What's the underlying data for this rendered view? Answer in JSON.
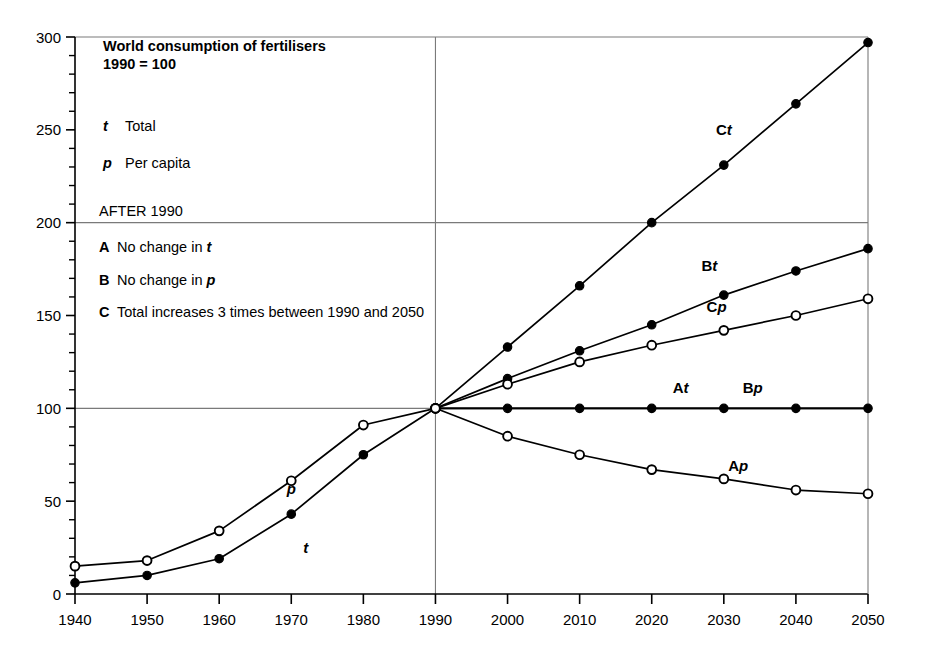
{
  "chart_data": {
    "type": "line",
    "title": "World consumption of fertilisers",
    "subtitle": "1990 = 100",
    "xlabel": "",
    "ylabel": "",
    "xlim": [
      1940,
      2050
    ],
    "ylim": [
      0,
      300
    ],
    "x_ticks": [
      "1940",
      "1950",
      "1960",
      "1970",
      "1980",
      "1990",
      "2000",
      "2010",
      "2020",
      "2030",
      "2040",
      "2050"
    ],
    "y_ticks": [
      "0",
      "50",
      "100",
      "150",
      "200",
      "250",
      "300"
    ],
    "y_minor_tick_step": 10,
    "grid": "horizontal gridlines at 100, 200, 300; vertical gridline at 1990",
    "legend_position": "inside-top-left",
    "legend": [
      {
        "key": "t",
        "key_style": "bold-italic",
        "label": "Total"
      },
      {
        "key": "p",
        "key_style": "bold-italic",
        "label": "Per capita"
      }
    ],
    "scenario_heading": "AFTER 1990",
    "scenarios": [
      {
        "key": "A",
        "label_prefix": "No change in ",
        "label_symbol": "t"
      },
      {
        "key": "B",
        "label_prefix": "No change in ",
        "label_symbol": "p"
      },
      {
        "key": "C",
        "label_prefix": "Total increases 3 times between 1990 and 2050",
        "label_symbol": ""
      }
    ],
    "marker_legend": {
      "filled_circle": "Total (t) series",
      "open_circle": "Per capita (p) series"
    },
    "series": [
      {
        "name": "t",
        "display_label": "t",
        "label_style": "bold-italic",
        "marker": "filled-circle",
        "period": "historical",
        "x": [
          1940,
          1950,
          1960,
          1970,
          1980,
          1990
        ],
        "values": [
          6,
          10,
          19,
          43,
          75,
          100
        ],
        "label_pos": {
          "x": 1972,
          "y": 22
        }
      },
      {
        "name": "p",
        "display_label": "p",
        "label_style": "bold-italic",
        "marker": "open-circle",
        "period": "historical",
        "x": [
          1940,
          1950,
          1960,
          1970,
          1980,
          1990
        ],
        "values": [
          15,
          18,
          34,
          61,
          91,
          100
        ],
        "label_pos": {
          "x": 1970,
          "y": 54
        }
      },
      {
        "name": "Ct",
        "display_label": "Ct",
        "label_style": "bold + bold-italic",
        "marker": "filled-circle",
        "period": "projection",
        "x": [
          1990,
          2000,
          2010,
          2020,
          2030,
          2040,
          2050
        ],
        "values": [
          100,
          133,
          166,
          200,
          231,
          264,
          297
        ],
        "label_pos": {
          "x": 2030,
          "y": 247
        }
      },
      {
        "name": "Bt",
        "display_label": "Bt",
        "label_style": "bold + bold-italic",
        "marker": "filled-circle",
        "period": "projection",
        "x": [
          1990,
          2000,
          2010,
          2020,
          2030,
          2040,
          2050
        ],
        "values": [
          100,
          116,
          131,
          145,
          161,
          174,
          186
        ],
        "label_pos": {
          "x": 2028,
          "y": 174
        }
      },
      {
        "name": "Cp",
        "display_label": "Cp",
        "label_style": "bold + bold-italic",
        "marker": "open-circle",
        "period": "projection",
        "x": [
          1990,
          2000,
          2010,
          2020,
          2030,
          2040,
          2050
        ],
        "values": [
          100,
          113,
          125,
          134,
          142,
          150,
          159
        ],
        "label_pos": {
          "x": 2029,
          "y": 152
        }
      },
      {
        "name": "At",
        "display_label": "At",
        "label_style": "bold + bold-italic",
        "marker": "filled-circle",
        "period": "projection",
        "x": [
          1990,
          2000,
          2010,
          2020,
          2030,
          2040,
          2050
        ],
        "values": [
          100,
          100,
          100,
          100,
          100,
          100,
          100
        ],
        "label_pos": {
          "x": 2024,
          "y": 108
        }
      },
      {
        "name": "Bp",
        "display_label": "Bp",
        "label_style": "bold + bold-italic",
        "marker": "filled-circle",
        "period": "projection",
        "note": "coincident with At along the 100 line",
        "x": [
          1990,
          2050
        ],
        "values": [
          100,
          100
        ],
        "label_pos": {
          "x": 2034,
          "y": 108
        }
      },
      {
        "name": "Ap",
        "display_label": "Ap",
        "label_style": "bold + bold-italic",
        "marker": "open-circle",
        "period": "projection",
        "x": [
          1990,
          2000,
          2010,
          2020,
          2030,
          2040,
          2050
        ],
        "values": [
          100,
          85,
          75,
          67,
          62,
          56,
          54
        ],
        "label_pos": {
          "x": 2032,
          "y": 66
        }
      }
    ],
    "colors": {
      "line": "#000000",
      "grid": "#7a7a7a",
      "axis": "#000000",
      "background": "#ffffff",
      "marker_fill_open": "#ffffff"
    }
  }
}
